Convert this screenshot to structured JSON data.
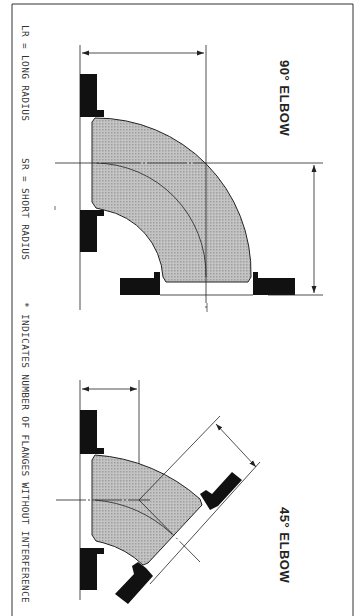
{
  "figure": {
    "orientation": "rotated-90-clockwise",
    "background": "#ffffff",
    "line_color": "#222222",
    "fitting_fill": "#b8b8b8",
    "flange_fill": "#111111"
  },
  "legend": {
    "long_radius": "LR = LONG RADIUS",
    "short_radius": "SR = SHORT RADIUS",
    "note": "* INDICATES NUMBER OF FLANGES WITHOUT INTERFERENCE"
  },
  "diagrams": [
    {
      "title": "90° ELBOW",
      "angle": 90
    },
    {
      "title": "45° ELBOW",
      "angle": 45
    }
  ]
}
